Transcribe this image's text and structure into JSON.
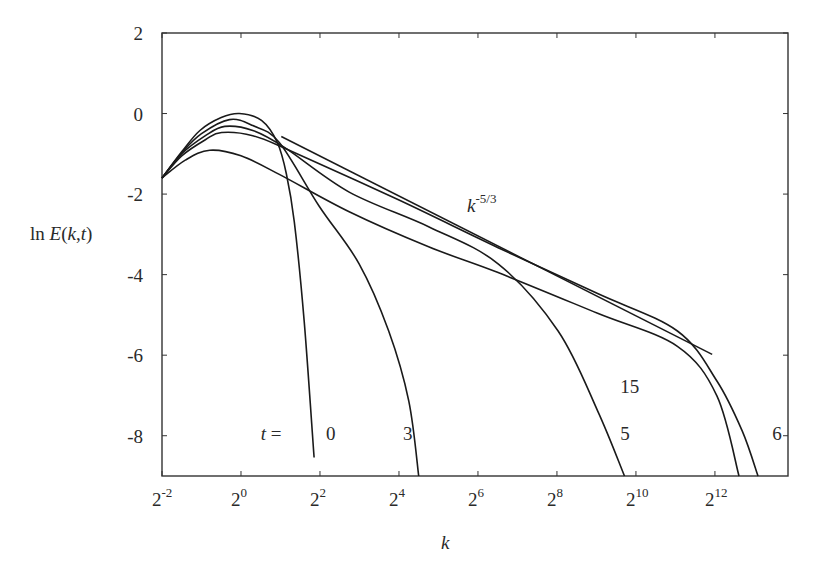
{
  "chart_data": {
    "type": "line",
    "title": "",
    "xlabel": "k",
    "ylabel": "ln E(k,t)",
    "x_scale": "log2",
    "x_unit_note": "x values are log2(k)",
    "xlim": [
      -2,
      13.85
    ],
    "ylim": [
      -9,
      2
    ],
    "grid": false,
    "x_ticks": [
      {
        "value": -2,
        "base": "2",
        "exp": "-2"
      },
      {
        "value": 0,
        "base": "2",
        "exp": "0"
      },
      {
        "value": 2,
        "base": "2",
        "exp": "2"
      },
      {
        "value": 4,
        "base": "2",
        "exp": "4"
      },
      {
        "value": 6,
        "base": "2",
        "exp": "6"
      },
      {
        "value": 8,
        "base": "2",
        "exp": "8"
      },
      {
        "value": 10,
        "base": "2",
        "exp": "10"
      },
      {
        "value": 12,
        "base": "2",
        "exp": "12"
      }
    ],
    "y_ticks": [
      {
        "value": 2,
        "label": "2"
      },
      {
        "value": 0,
        "label": "0"
      },
      {
        "value": -2,
        "label": "-2"
      },
      {
        "value": -4,
        "label": "-4"
      },
      {
        "value": -6,
        "label": "-6"
      },
      {
        "value": -8,
        "label": "-8"
      }
    ],
    "series": [
      {
        "name": "t = 0",
        "label": "0",
        "x": [
          -2,
          -1.5,
          -1.04,
          -0.5,
          -0.04,
          0.52,
          0.92,
          1.15,
          1.35,
          1.6,
          1.85
        ],
        "y": [
          -1.6,
          -0.95,
          -0.42,
          -0.1,
          0,
          -0.17,
          -0.72,
          -1.5,
          -2.69,
          -5.16,
          -8.54
        ]
      },
      {
        "name": "t = 3",
        "label": "3",
        "x": [
          -2,
          -1.5,
          -1.0,
          -0.29,
          0.3,
          0.97,
          1.98,
          2.99,
          3.74,
          4.25,
          4.5
        ],
        "y": [
          -1.6,
          -0.98,
          -0.5,
          -0.15,
          -0.3,
          -0.72,
          -2.3,
          -3.73,
          -5.4,
          -7.14,
          -9
        ]
      },
      {
        "name": "t = 5",
        "label": "5",
        "x": [
          -2,
          -1.5,
          -0.9,
          -0.41,
          0.3,
          1.1,
          2.74,
          4.75,
          6.51,
          8.03,
          9.03,
          9.71
        ],
        "y": [
          -1.6,
          -1.0,
          -0.55,
          -0.32,
          -0.42,
          -0.84,
          -1.95,
          -2.81,
          -3.73,
          -5.4,
          -7.38,
          -9
        ]
      },
      {
        "name": "t = 6",
        "label": "6",
        "x": [
          -2,
          -1.5,
          -0.9,
          -0.49,
          0.3,
          1.22,
          4.0,
          6.51,
          9.03,
          11.05,
          12.05,
          12.69,
          13.09
        ],
        "y": [
          -1.6,
          -1.05,
          -0.65,
          -0.47,
          -0.55,
          -0.91,
          -2.15,
          -3.33,
          -4.47,
          -5.4,
          -6.64,
          -7.88,
          -9
        ]
      },
      {
        "name": "t = 15",
        "label": "15",
        "x": [
          -2,
          -1.4,
          -0.79,
          0.0,
          0.97,
          2.74,
          4.75,
          6.51,
          9.03,
          11.05,
          12.05,
          12.61
        ],
        "y": [
          -1.6,
          -1.15,
          -0.91,
          -1.05,
          -1.51,
          -2.44,
          -3.31,
          -3.95,
          -4.96,
          -5.78,
          -7.01,
          -9
        ]
      }
    ],
    "reference_line": {
      "name": "k^-5/3",
      "label_base": "k",
      "label_exp": "-5/3",
      "x": [
        1.02,
        11.93
      ],
      "y": [
        -0.57,
        -5.98
      ]
    },
    "annotations": [
      {
        "text": "t =",
        "x": 0.5,
        "y": -8.1
      },
      {
        "text": "0",
        "x": 2.15,
        "y": -8.1
      },
      {
        "text": "3",
        "x": 4.1,
        "y": -8.1
      },
      {
        "text": "5",
        "x": 9.6,
        "y": -8.1
      },
      {
        "text": "15",
        "x": 9.6,
        "y": -6.95
      },
      {
        "text": "6",
        "x": 13.45,
        "y": -8.1
      }
    ]
  }
}
